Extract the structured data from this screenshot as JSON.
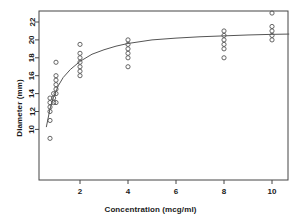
{
  "chart_data": {
    "type": "scatter",
    "title": "",
    "xlabel": "Concentration (mcg/ml)",
    "ylabel": "Diameter (mm)",
    "xlim": [
      0.3,
      10.7
    ],
    "ylim": [
      8.5,
      23.4
    ],
    "xticks": [
      2,
      4,
      6,
      8,
      10
    ],
    "yticks": [
      10,
      12,
      14,
      16,
      18,
      20,
      22
    ],
    "grid": false,
    "legend": null,
    "marker": "open-circle",
    "marker_color": "#555555",
    "line_color": "#555555",
    "frame": true,
    "points": [
      {
        "x": 0.75,
        "y": 9.0
      },
      {
        "x": 0.75,
        "y": 11.0
      },
      {
        "x": 0.75,
        "y": 12.0
      },
      {
        "x": 0.75,
        "y": 12.5
      },
      {
        "x": 0.75,
        "y": 13.5
      },
      {
        "x": 0.75,
        "y": 13.0
      },
      {
        "x": 0.9,
        "y": 13.0
      },
      {
        "x": 0.9,
        "y": 13.5
      },
      {
        "x": 0.9,
        "y": 14.0
      },
      {
        "x": 1.0,
        "y": 13.0
      },
      {
        "x": 1.0,
        "y": 14.0
      },
      {
        "x": 1.0,
        "y": 14.5
      },
      {
        "x": 1.0,
        "y": 15.0
      },
      {
        "x": 1.0,
        "y": 15.5
      },
      {
        "x": 1.0,
        "y": 16.0
      },
      {
        "x": 1.0,
        "y": 17.5
      },
      {
        "x": 2.0,
        "y": 16.0
      },
      {
        "x": 2.0,
        "y": 16.5
      },
      {
        "x": 2.0,
        "y": 17.0
      },
      {
        "x": 2.0,
        "y": 17.5
      },
      {
        "x": 2.0,
        "y": 18.0
      },
      {
        "x": 2.0,
        "y": 18.5
      },
      {
        "x": 2.0,
        "y": 19.5
      },
      {
        "x": 4.0,
        "y": 17.0
      },
      {
        "x": 4.0,
        "y": 18.0
      },
      {
        "x": 4.0,
        "y": 18.5
      },
      {
        "x": 4.0,
        "y": 19.0
      },
      {
        "x": 4.0,
        "y": 19.5
      },
      {
        "x": 4.0,
        "y": 20.0
      },
      {
        "x": 8.0,
        "y": 18.0
      },
      {
        "x": 8.0,
        "y": 19.0
      },
      {
        "x": 8.0,
        "y": 19.5
      },
      {
        "x": 8.0,
        "y": 20.0
      },
      {
        "x": 8.0,
        "y": 20.5
      },
      {
        "x": 8.0,
        "y": 21.0
      },
      {
        "x": 10.0,
        "y": 20.0
      },
      {
        "x": 10.0,
        "y": 20.5
      },
      {
        "x": 10.0,
        "y": 21.0
      },
      {
        "x": 10.0,
        "y": 21.5
      },
      {
        "x": 10.0,
        "y": 23.0
      }
    ],
    "fit_curve": {
      "form": "logarithmic",
      "label": "",
      "x": [
        0.6,
        0.75,
        0.9,
        1.1,
        1.3,
        1.6,
        2.0,
        2.5,
        3.0,
        3.5,
        4.0,
        5.0,
        6.0,
        7.0,
        8.0,
        9.0,
        10.0,
        10.7
      ],
      "y": [
        10.3,
        12.3,
        13.6,
        14.9,
        15.8,
        16.7,
        17.6,
        18.4,
        18.9,
        19.3,
        19.6,
        20.0,
        20.2,
        20.35,
        20.45,
        20.55,
        20.62,
        20.65
      ]
    }
  },
  "ticklabels": {
    "x": [
      "2",
      "4",
      "6",
      "8",
      "10"
    ],
    "y": [
      "10",
      "12",
      "14",
      "16",
      "18",
      "20",
      "22"
    ]
  }
}
